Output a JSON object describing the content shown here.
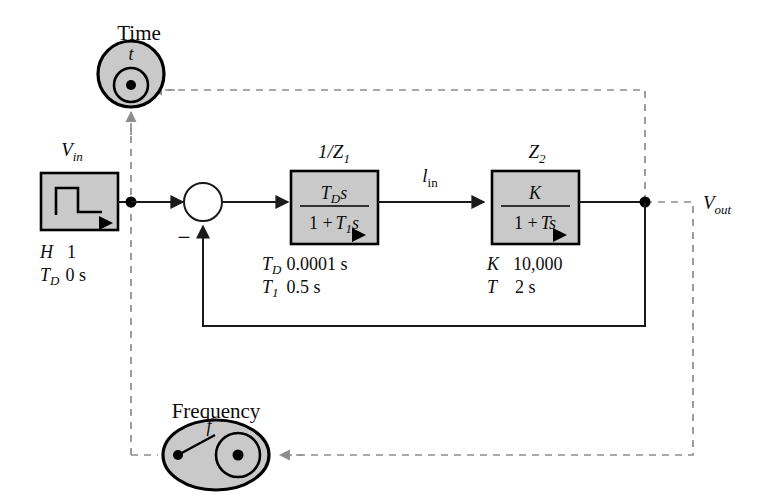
{
  "diagram": {
    "title_time_probe": "Time",
    "title_frequency_probe": "Frequency",
    "probes": {
      "time": {
        "symbol": "t",
        "name": "time-probe"
      },
      "frequency": {
        "symbol": "f",
        "name": "frequency-probe"
      }
    },
    "source_block": {
      "label": "V",
      "label_sub": "in",
      "icon": "step-waveform-icon",
      "params": [
        {
          "name": "H",
          "sub": "",
          "value": "1"
        },
        {
          "name": "T",
          "sub": "D",
          "value": "0 s"
        }
      ]
    },
    "summing_junction": {
      "name": "summing-junction",
      "feedback_sign": "−"
    },
    "block1": {
      "label": "1/Z",
      "label_sub": "1",
      "numerator": "T",
      "numerator_sub": "D",
      "numerator_tail": "s",
      "denominator_lead": "1 +",
      "denominator": "T",
      "denominator_sub": "1",
      "denominator_tail": "s",
      "params": [
        {
          "name": "T",
          "sub": "D",
          "value": "0.0001 s"
        },
        {
          "name": "T",
          "sub": "1",
          "value": "0.5 s"
        }
      ]
    },
    "block2": {
      "label": "Z",
      "label_sub": "2",
      "numerator": "K",
      "denominator_lead": "1 +",
      "denominator": "T",
      "denominator_tail": "s",
      "params": [
        {
          "name": "K",
          "sub": "",
          "value": "10,000"
        },
        {
          "name": "T",
          "sub": "",
          "value": "2 s"
        }
      ]
    },
    "signal_mid": {
      "label": "l",
      "label_sub": "in"
    },
    "signal_out": {
      "label": "V",
      "label_sub": "out"
    },
    "colors": {
      "block_fill": "#c9c9c9",
      "stroke": "#000000",
      "signal": "#1a1a1a",
      "dashed": "#8d8d8d"
    }
  }
}
